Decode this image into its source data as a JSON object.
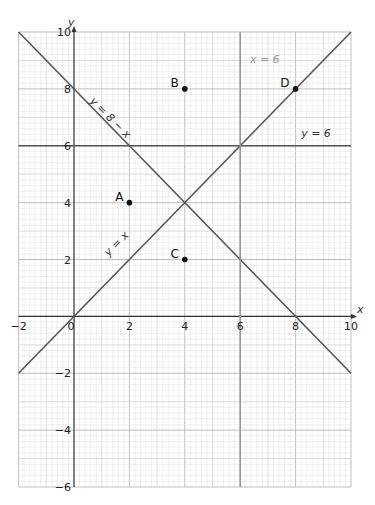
{
  "chart_data": {
    "type": "line",
    "title": "",
    "xlabel": "x",
    "ylabel": "y",
    "xlim": [
      -2,
      10
    ],
    "ylim": [
      -6,
      10
    ],
    "grid": true,
    "x_ticks": [
      -2,
      0,
      2,
      4,
      6,
      8,
      10
    ],
    "y_ticks": [
      -6,
      -4,
      -2,
      2,
      4,
      6,
      8,
      10
    ],
    "origin_label": "0",
    "lines": [
      {
        "name": "y = 8 − x",
        "label": "y = 8 − x",
        "from": [
          -2,
          10
        ],
        "to": [
          10,
          -2
        ],
        "color": "#555555"
      },
      {
        "name": "y = x",
        "label": "y = x",
        "from": [
          -2,
          -2
        ],
        "to": [
          10,
          10
        ],
        "color": "#555555"
      },
      {
        "name": "y = 6",
        "label": "y = 6",
        "from": [
          -2,
          6
        ],
        "to": [
          10,
          6
        ],
        "color": "#555555"
      },
      {
        "name": "x = 6",
        "label": "x = 6",
        "from": [
          6,
          -6
        ],
        "to": [
          6,
          10
        ],
        "color": "#999999"
      }
    ],
    "points": [
      {
        "name": "A",
        "x": 2,
        "y": 4
      },
      {
        "name": "B",
        "x": 4,
        "y": 8
      },
      {
        "name": "C",
        "x": 4,
        "y": 2
      },
      {
        "name": "D",
        "x": 8,
        "y": 8
      }
    ],
    "line_labels": [
      {
        "text": "y = 8 − x",
        "x": 0.55,
        "y": 7.55,
        "rotate": 45,
        "style": "italic"
      },
      {
        "text": "y = x",
        "x": 1.25,
        "y": 2.1,
        "rotate": -45,
        "style": "italic"
      },
      {
        "text": "y = 6",
        "x": 8.2,
        "y": 6.3,
        "rotate": 0,
        "style": "italic"
      },
      {
        "text": "x = 6",
        "x": 6.35,
        "y": 8.9,
        "rotate": 0,
        "style": "grey"
      }
    ]
  },
  "colors": {
    "minor_grid": "#e4e4e4",
    "unit_grid": "#cfcfcf",
    "major_grid": "#b8b8b8",
    "axis": "#333333",
    "point": "#111111"
  }
}
